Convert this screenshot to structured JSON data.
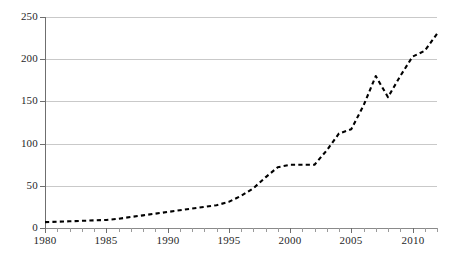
{
  "chart_data": {
    "type": "line",
    "title": "",
    "subtitle": "",
    "xlabel": "",
    "ylabel": "",
    "xlim": [
      1980,
      2012
    ],
    "ylim": [
      0,
      250
    ],
    "grid": true,
    "legend": null,
    "legend_position": "none",
    "line_style": "dashed",
    "line_color": "#000000",
    "markers": false,
    "y_ticks": [
      0,
      50,
      100,
      150,
      200,
      250
    ],
    "y_tick_labels": [
      "0",
      "50",
      "100",
      "150",
      "200",
      "250"
    ],
    "x_ticks": [
      1980,
      1985,
      1990,
      1995,
      2000,
      2005,
      2010
    ],
    "x_tick_labels": [
      "1980",
      "1985",
      "1990",
      "1995",
      "2000",
      "2005",
      "2010"
    ],
    "x_minor_tick_interval": 1,
    "x": [
      1980,
      1981,
      1982,
      1983,
      1984,
      1985,
      1986,
      1987,
      1988,
      1989,
      1990,
      1991,
      1992,
      1993,
      1994,
      1995,
      1996,
      1997,
      1998,
      1999,
      2000,
      2001,
      2002,
      2003,
      2004,
      2005,
      2006,
      2007,
      2008,
      2009,
      2010,
      2011,
      2012
    ],
    "values": [
      7,
      7.5,
      8,
      8.5,
      9,
      9.5,
      11,
      13,
      15,
      17,
      19,
      21,
      23,
      25,
      27,
      31,
      38,
      47,
      60,
      72,
      75,
      75,
      75,
      92,
      112,
      117,
      145,
      180,
      155,
      180,
      203,
      210,
      230
    ],
    "series": [
      {
        "name": "series-1",
        "values": [
          7,
          7.5,
          8,
          8.5,
          9,
          9.5,
          11,
          13,
          15,
          17,
          19,
          21,
          23,
          25,
          27,
          31,
          38,
          47,
          60,
          72,
          75,
          75,
          75,
          92,
          112,
          117,
          145,
          180,
          155,
          180,
          203,
          210,
          230
        ]
      }
    ]
  }
}
